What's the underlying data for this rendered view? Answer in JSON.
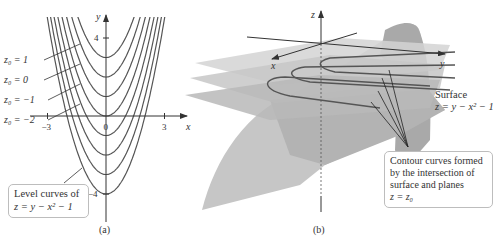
{
  "figure": {
    "panel_a": {
      "caption": "(a)",
      "axes": {
        "x_label": "x",
        "y_label": "y",
        "x_ticks": [
          {
            "value": -3,
            "label": "−3"
          },
          {
            "value": 0,
            "label": "0"
          },
          {
            "value": 3,
            "label": "3"
          }
        ],
        "y_ticks": [
          {
            "value": 4,
            "label": "4"
          },
          {
            "value": -4,
            "label": "−4"
          }
        ]
      },
      "curve_labels": [
        {
          "text": "z₀ = 1",
          "z0": 1
        },
        {
          "text": "z₀ = 0",
          "z0": 0
        },
        {
          "text": "z₀ = −1",
          "z0": -1
        },
        {
          "text": "z₀ = −2",
          "z0": -2
        }
      ],
      "level_curves_z0": [
        2,
        1,
        0,
        -1,
        -2,
        -3,
        -4,
        -5
      ],
      "callout": {
        "line1": "Level curves of",
        "line2": "z = y − x² − 1"
      }
    },
    "panel_b": {
      "caption": "(b)",
      "axes": {
        "x_label": "x",
        "y_label": "y",
        "z_label": "z"
      },
      "surface_label": {
        "line1": "Surface",
        "line2": "z = y − x² − 1"
      },
      "callout": {
        "line1": "Contour curves formed",
        "line2": "by the intersection of",
        "line3": "surface and planes",
        "line4": "z = z₀"
      },
      "plane_count": 3
    },
    "colors": {
      "line": "#555555",
      "text": "#333333",
      "surface_light": "#c8c8c8",
      "surface_dark": "#a8a8a8",
      "plane": "#d9d9d9",
      "callout_border": "#bdbdbd"
    }
  }
}
